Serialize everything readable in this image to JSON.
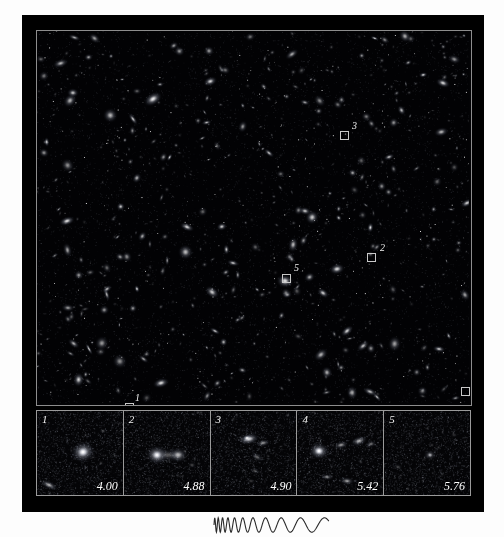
{
  "figure": {
    "kind": "deep-field-astronomical-plate",
    "background_color": "#fdfdfd",
    "plate_color": "#000000",
    "frame_border_color": "#8d8d8d"
  },
  "sky_field": {
    "name": "deep-field-survey-image",
    "markers": [
      {
        "label": "1",
        "box_x": 88,
        "box_y": 372,
        "label_x": 98,
        "label_y": 362
      },
      {
        "label": "2",
        "box_x": 330,
        "box_y": 222,
        "label_x": 343,
        "label_y": 212
      },
      {
        "label": "3",
        "box_x": 303,
        "box_y": 100,
        "label_x": 315,
        "label_y": 90
      },
      {
        "label": "4",
        "box_x": 424,
        "box_y": 356,
        "label_x": 434,
        "label_y": 346
      },
      {
        "label": "5",
        "box_x": 245,
        "box_y": 243,
        "label_x": 257,
        "label_y": 232
      }
    ]
  },
  "thumbnails": {
    "name": "redshift-candidate-cutouts",
    "panels": [
      {
        "index": "1",
        "redshift": "4.00",
        "morphology": "compact-bright-core-with-companion"
      },
      {
        "index": "2",
        "redshift": "4.88",
        "morphology": "double-merging-pair"
      },
      {
        "index": "3",
        "redshift": "4.90",
        "morphology": "elongated-tadpole-with-tail"
      },
      {
        "index": "4",
        "redshift": "5.42",
        "morphology": "clumpy-chain-multiple-knots"
      },
      {
        "index": "5",
        "redshift": "5.76",
        "morphology": "very-faint-diffuse-point-source"
      }
    ]
  },
  "caption": {
    "waveform_name": "redshift-stretching-waveform",
    "waveform_description": "wave stretching from short to long wavelength",
    "text": ""
  },
  "chart_data": {
    "type": "table",
    "categories": [
      "1",
      "2",
      "3",
      "4",
      "5"
    ],
    "values": [
      4.0,
      4.88,
      4.9,
      5.42,
      5.76
    ],
    "xlabel": "Candidate",
    "ylabel": "Redshift z",
    "ylim": [
      4.0,
      5.76
    ]
  }
}
